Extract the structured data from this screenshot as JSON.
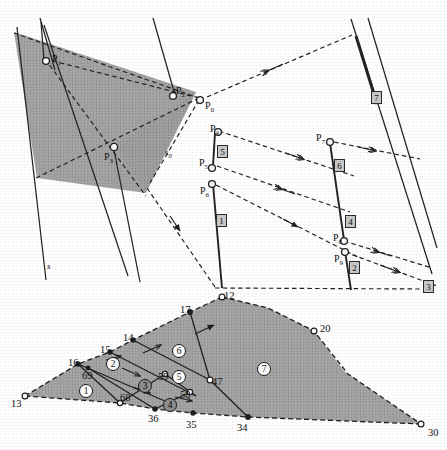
{
  "figure": {
    "background_color": "#ffffff",
    "ink_color": "#1a1a1a",
    "shade_fill": "#9a9a9a"
  },
  "upper_diagram": {
    "name": "visibility-line-construction",
    "point_labels": [
      {
        "id": "P0",
        "text": "P",
        "sub": "0",
        "x": 205,
        "y": 101
      },
      {
        "id": "P1",
        "text": "P",
        "sub": "1",
        "x": 52,
        "y": 54
      },
      {
        "id": "P2",
        "text": "P",
        "sub": "2",
        "x": 176,
        "y": 86
      },
      {
        "id": "P3",
        "text": "P",
        "sub": "3",
        "x": 104,
        "y": 152
      },
      {
        "id": "P4",
        "text": "P",
        "sub": "4",
        "x": 210,
        "y": 124
      },
      {
        "id": "P5",
        "text": "P",
        "sub": "5",
        "x": 199,
        "y": 158
      },
      {
        "id": "P6",
        "text": "P",
        "sub": "6",
        "x": 200,
        "y": 186
      },
      {
        "id": "P7",
        "text": "P",
        "sub": "7",
        "x": 316,
        "y": 133
      },
      {
        "id": "P8",
        "text": "P",
        "sub": "8",
        "x": 333,
        "y": 233
      },
      {
        "id": "P9",
        "text": "P",
        "sub": "9",
        "x": 334,
        "y": 254
      }
    ],
    "line_labels": [
      {
        "id": "s",
        "text": "s",
        "sub": "",
        "x": 47,
        "y": 262
      },
      {
        "id": "s0",
        "text": "s",
        "sub": "0",
        "x": 165,
        "y": 148
      }
    ],
    "segment_boxes": [
      {
        "label": "1",
        "x": 216,
        "y": 214
      },
      {
        "label": "2",
        "x": 349,
        "y": 261
      },
      {
        "label": "3",
        "x": 423,
        "y": 280
      },
      {
        "label": "4",
        "x": 345,
        "y": 215
      },
      {
        "label": "5",
        "x": 217,
        "y": 145
      },
      {
        "label": "6",
        "x": 334,
        "y": 159
      },
      {
        "label": "7",
        "x": 371,
        "y": 91
      }
    ]
  },
  "lower_diagram": {
    "name": "triangulated-polygon",
    "vertex_labels": [
      {
        "label": "13",
        "x": 11,
        "y": 399
      },
      {
        "label": "16",
        "x": 68,
        "y": 358
      },
      {
        "label": "15",
        "x": 100,
        "y": 345
      },
      {
        "label": "14",
        "x": 123,
        "y": 333
      },
      {
        "label": "17",
        "x": 180,
        "y": 305
      },
      {
        "label": "12",
        "x": 224,
        "y": 291
      },
      {
        "label": "20",
        "x": 320,
        "y": 324
      },
      {
        "label": "30",
        "x": 428,
        "y": 428
      },
      {
        "label": "34",
        "x": 237,
        "y": 423
      },
      {
        "label": "35",
        "x": 186,
        "y": 420
      },
      {
        "label": "36",
        "x": 148,
        "y": 414
      },
      {
        "label": "47",
        "x": 212,
        "y": 377
      },
      {
        "label": "58",
        "x": 180,
        "y": 390
      },
      {
        "label": "59",
        "x": 158,
        "y": 372
      },
      {
        "label": "68",
        "x": 120,
        "y": 393
      },
      {
        "label": "69",
        "x": 82,
        "y": 371
      }
    ],
    "face_labels": [
      {
        "label": "1",
        "x": 79,
        "y": 384,
        "dark": false
      },
      {
        "label": "2",
        "x": 106,
        "y": 357,
        "dark": false
      },
      {
        "label": "3",
        "x": 138,
        "y": 379,
        "dark": true
      },
      {
        "label": "4",
        "x": 163,
        "y": 398,
        "dark": true
      },
      {
        "label": "5",
        "x": 172,
        "y": 370,
        "dark": false
      },
      {
        "label": "6",
        "x": 172,
        "y": 344,
        "dark": false
      },
      {
        "label": "7",
        "x": 257,
        "y": 362,
        "dark": false
      }
    ]
  }
}
